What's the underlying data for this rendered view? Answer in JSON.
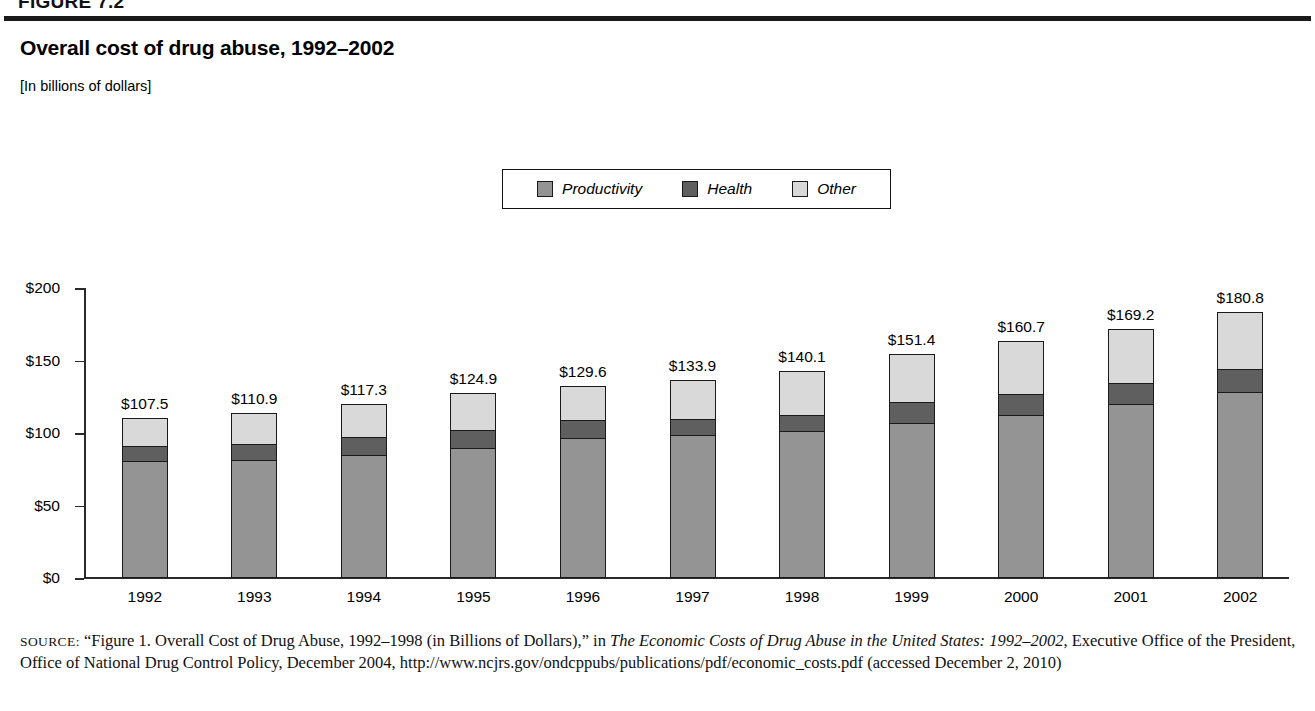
{
  "figure": {
    "tag": "FIGURE 7.2",
    "title": "Overall cost of drug abuse, 1992–2002",
    "subtitle": "[In billions of dollars]"
  },
  "legend": {
    "items": [
      {
        "label": "Productivity",
        "color": "#949494",
        "swatch_name": "legend-swatch-productivity"
      },
      {
        "label": "Health",
        "color": "#5f5f5f",
        "swatch_name": "legend-swatch-health"
      },
      {
        "label": "Other",
        "color": "#d9d9d9",
        "swatch_name": "legend-swatch-other"
      }
    ]
  },
  "chart_data": {
    "type": "bar",
    "title": "Overall cost of drug abuse, 1992–2002",
    "subtitle": "[In billions of dollars]",
    "stacked": true,
    "xlabel": "",
    "ylabel": "",
    "ylim": [
      0,
      200
    ],
    "yticks": [
      0,
      50,
      100,
      150,
      200
    ],
    "ytick_labels": [
      "$0",
      "$50",
      "$100",
      "$150",
      "$200"
    ],
    "grid": false,
    "legend_position": "top-center",
    "categories": [
      "1992",
      "1993",
      "1994",
      "1995",
      "1996",
      "1997",
      "1998",
      "1999",
      "2000",
      "2001",
      "2002"
    ],
    "series": [
      {
        "name": "Productivity",
        "color": "#949494",
        "values": [
          79.0,
          80.1,
          83.8,
          88.4,
          95.2,
          97.0,
          99.9,
          105.8,
          110.8,
          118.5,
          127.0
        ]
      },
      {
        "name": "Health",
        "color": "#5f5f5f",
        "values": [
          10.1,
          10.6,
          11.7,
          11.9,
          11.7,
          10.5,
          10.2,
          13.4,
          14.0,
          14.2,
          15.2
        ]
      },
      {
        "name": "Other",
        "color": "#d9d9d9",
        "values": [
          18.4,
          20.2,
          21.8,
          24.6,
          22.7,
          26.4,
          30.0,
          32.2,
          35.9,
          36.5,
          38.6
        ]
      }
    ],
    "totals": [
      107.5,
      110.9,
      117.3,
      124.9,
      129.6,
      133.9,
      140.1,
      151.4,
      160.7,
      169.2,
      180.8
    ],
    "total_labels": [
      "$107.5",
      "$110.9",
      "$117.3",
      "$124.9",
      "$129.6",
      "$133.9",
      "$140.1",
      "$151.4",
      "$160.7",
      "$169.2",
      "$180.8"
    ]
  },
  "source": {
    "label": "SOURCE:",
    "line1_pre": " “Figure 1. Overall Cost of Drug Abuse, 1992–1998 (in Billions of Dollars),” in ",
    "title_italic": "The Economic Costs of Drug Abuse in the United States: 1992–2002",
    "line2_post": ", Executive Office of the President, Office of National Drug Control Policy, December 2004, http://www.ncjrs.gov/ondcppubs/publications/pdf/economic_costs.pdf (accessed December 2, 2010)"
  }
}
